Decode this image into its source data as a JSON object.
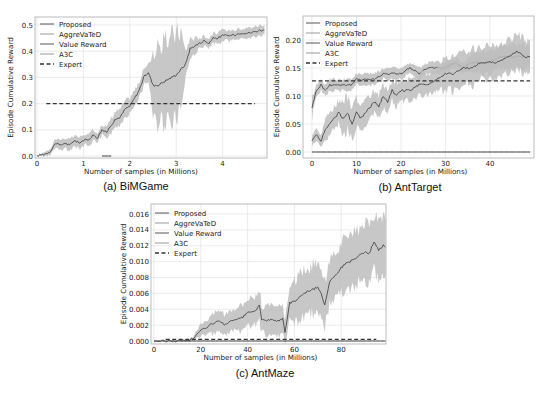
{
  "chart_data": [
    {
      "id": "a",
      "type": "line",
      "caption": "(a) BiMGame",
      "xlabel": "Number of samples (in Millions)",
      "ylabel": "Episode Cumulative Reward",
      "xticks": [
        0,
        1,
        2,
        3,
        4
      ],
      "yticks": [
        "0.0",
        "0.1",
        "0.2",
        "0.3",
        "0.4",
        "0.5"
      ],
      "xlim": [
        0,
        4.9
      ],
      "ylim": [
        0,
        0.52
      ],
      "grid": true,
      "legend_position": "upper left",
      "legend": [
        "Proposed",
        "AggreVaTeD",
        "Value Reward",
        "A3C",
        "Expert"
      ],
      "series": [
        {
          "name": "Proposed",
          "x": [
            0.0,
            0.2,
            0.3,
            0.4,
            0.5,
            0.6,
            0.7,
            0.8,
            0.9,
            1.0,
            1.1,
            1.2,
            1.3,
            1.4,
            1.5,
            1.6,
            1.7,
            1.8,
            1.9,
            2.0,
            2.1,
            2.2,
            2.3,
            2.4,
            2.5,
            2.6,
            2.7,
            2.8,
            2.9,
            3.0,
            3.1,
            3.2,
            3.3,
            3.4,
            3.5,
            3.6,
            3.7,
            3.8,
            3.9,
            4.0,
            4.2,
            4.4,
            4.6,
            4.8,
            4.9
          ],
          "y": [
            0.0,
            0.01,
            0.02,
            0.05,
            0.04,
            0.05,
            0.04,
            0.06,
            0.05,
            0.06,
            0.06,
            0.08,
            0.07,
            0.1,
            0.09,
            0.12,
            0.14,
            0.15,
            0.18,
            0.19,
            0.22,
            0.25,
            0.3,
            0.32,
            0.27,
            0.27,
            0.28,
            0.29,
            0.3,
            0.31,
            0.33,
            0.35,
            0.41,
            0.42,
            0.43,
            0.44,
            0.43,
            0.45,
            0.45,
            0.46,
            0.46,
            0.47,
            0.47,
            0.48,
            0.48
          ],
          "band": [
            0.0,
            0.01,
            0.01,
            0.02,
            0.02,
            0.02,
            0.02,
            0.02,
            0.02,
            0.02,
            0.02,
            0.02,
            0.02,
            0.02,
            0.02,
            0.03,
            0.03,
            0.03,
            0.03,
            0.03,
            0.03,
            0.03,
            0.03,
            0.03,
            0.13,
            0.14,
            0.15,
            0.15,
            0.16,
            0.16,
            0.15,
            0.05,
            0.04,
            0.03,
            0.02,
            0.02,
            0.02,
            0.02,
            0.02,
            0.02,
            0.02,
            0.02,
            0.02,
            0.02,
            0.02
          ]
        },
        {
          "name": "AggreVaTeD",
          "x": [],
          "y": []
        },
        {
          "name": "Value Reward",
          "x": [
            1.4,
            1.6
          ],
          "y": [
            0.0,
            0.0
          ]
        },
        {
          "name": "A3C",
          "x": [],
          "y": []
        },
        {
          "name": "Expert",
          "x": [
            0.2,
            4.7
          ],
          "y": [
            0.2,
            0.2
          ],
          "style": "dashed"
        }
      ]
    },
    {
      "id": "b",
      "type": "line",
      "caption": "(b) AntTarget",
      "xlabel": "Number of samples (in Millions)",
      "ylabel": "Episode Cumulative Reward",
      "xticks": [
        0,
        10,
        20,
        30,
        40
      ],
      "yticks": [
        "0.00",
        "0.05",
        "0.10",
        "0.15",
        "0.20"
      ],
      "xlim": [
        0,
        49
      ],
      "ylim": [
        0,
        0.23
      ],
      "grid": true,
      "legend_position": "upper left",
      "legend": [
        "Proposed",
        "AggreVaTeD",
        "Value Reward",
        "A3C",
        "Expert"
      ],
      "series": [
        {
          "name": "Proposed",
          "x": [
            0,
            1,
            2,
            3,
            4,
            5,
            6,
            7,
            8,
            9,
            10,
            12,
            14,
            16,
            18,
            20,
            22,
            24,
            26,
            28,
            30,
            32,
            34,
            36,
            38,
            40,
            42,
            44,
            46,
            48,
            49
          ],
          "y": [
            0.08,
            0.11,
            0.12,
            0.11,
            0.12,
            0.12,
            0.12,
            0.12,
            0.12,
            0.12,
            0.13,
            0.13,
            0.13,
            0.14,
            0.14,
            0.14,
            0.15,
            0.14,
            0.15,
            0.15,
            0.15,
            0.16,
            0.15,
            0.16,
            0.16,
            0.16,
            0.17,
            0.17,
            0.17,
            0.17,
            0.17
          ],
          "band": [
            0.02,
            0.01,
            0.01,
            0.01,
            0.01,
            0.01,
            0.01,
            0.01,
            0.01,
            0.01,
            0.01,
            0.01,
            0.01,
            0.01,
            0.01,
            0.01,
            0.01,
            0.01,
            0.01,
            0.01,
            0.01,
            0.01,
            0.01,
            0.02,
            0.02,
            0.02,
            0.02,
            0.02,
            0.02,
            0.02,
            0.02
          ]
        },
        {
          "name": "AggreVaTeD",
          "x": [
            0,
            1,
            2,
            3,
            4,
            5,
            6,
            7,
            8,
            9,
            10,
            11,
            12,
            13,
            14,
            15,
            16,
            17,
            18,
            19,
            20,
            22,
            24,
            26,
            28,
            30,
            32,
            34,
            36,
            38,
            40,
            42,
            44,
            46,
            48,
            49
          ],
          "y": [
            0.02,
            0.03,
            0.02,
            0.04,
            0.05,
            0.06,
            0.07,
            0.06,
            0.07,
            0.05,
            0.07,
            0.06,
            0.07,
            0.08,
            0.09,
            0.08,
            0.1,
            0.09,
            0.11,
            0.1,
            0.11,
            0.11,
            0.12,
            0.12,
            0.13,
            0.14,
            0.14,
            0.15,
            0.15,
            0.16,
            0.16,
            0.16,
            0.17,
            0.18,
            0.17,
            0.17
          ],
          "band": [
            0.01,
            0.01,
            0.01,
            0.02,
            0.02,
            0.02,
            0.02,
            0.03,
            0.03,
            0.03,
            0.03,
            0.02,
            0.02,
            0.02,
            0.02,
            0.02,
            0.02,
            0.02,
            0.02,
            0.02,
            0.02,
            0.02,
            0.02,
            0.02,
            0.02,
            0.03,
            0.03,
            0.03,
            0.03,
            0.03,
            0.03,
            0.03,
            0.03,
            0.03,
            0.03,
            0.03
          ]
        },
        {
          "name": "Value Reward",
          "x": [
            0,
            49
          ],
          "y": [
            0.0,
            0.0
          ]
        },
        {
          "name": "A3C",
          "x": [],
          "y": []
        },
        {
          "name": "Expert",
          "x": [
            0,
            49
          ],
          "y": [
            0.127,
            0.127
          ],
          "style": "dashed"
        }
      ]
    },
    {
      "id": "c",
      "type": "line",
      "caption": "(c) AntMaze",
      "xlabel": "Number of samples (in Millions)",
      "ylabel": "Episode Cumulative Reward",
      "xticks": [
        0,
        20,
        40,
        60,
        80
      ],
      "yticks": [
        "0.000",
        "0.002",
        "0.004",
        "0.006",
        "0.008",
        "0.010",
        "0.012",
        "0.014",
        "0.016"
      ],
      "xlim": [
        0,
        99
      ],
      "ylim": [
        0,
        0.0172
      ],
      "grid": true,
      "legend_position": "upper left",
      "legend": [
        "Proposed",
        "AggreVaTeD",
        "Value Reward",
        "A3C",
        "Expert"
      ],
      "series": [
        {
          "name": "Proposed",
          "x": [
            0,
            5,
            10,
            15,
            17,
            20,
            22,
            25,
            28,
            30,
            32,
            35,
            38,
            40,
            43,
            45,
            46,
            47,
            50,
            53,
            55,
            56,
            57,
            58,
            60,
            62,
            64,
            66,
            68,
            70,
            72,
            73,
            75,
            78,
            80,
            82,
            85,
            88,
            90,
            92,
            94,
            96,
            98,
            99
          ],
          "y": [
            0.0,
            0.0,
            0.0,
            0.0001,
            0.0004,
            0.0013,
            0.0017,
            0.0022,
            0.0025,
            0.002,
            0.0024,
            0.0026,
            0.003,
            0.0035,
            0.0038,
            0.0044,
            0.0028,
            0.0026,
            0.0026,
            0.0026,
            0.0028,
            0.001,
            0.003,
            0.0048,
            0.005,
            0.0055,
            0.006,
            0.0063,
            0.0065,
            0.0068,
            0.0055,
            0.0045,
            0.0075,
            0.0085,
            0.0092,
            0.0098,
            0.0102,
            0.0108,
            0.0112,
            0.011,
            0.0125,
            0.0115,
            0.012,
            0.0118
          ],
          "band": [
            0,
            0,
            0,
            0.0001,
            0.0003,
            0.0008,
            0.001,
            0.0012,
            0.0014,
            0.0014,
            0.0015,
            0.0016,
            0.0017,
            0.0018,
            0.0019,
            0.002,
            0.0017,
            0.0017,
            0.0017,
            0.0017,
            0.0017,
            0.0012,
            0.002,
            0.0026,
            0.0026,
            0.0027,
            0.0028,
            0.0029,
            0.003,
            0.003,
            0.0028,
            0.0028,
            0.003,
            0.003,
            0.003,
            0.0031,
            0.0032,
            0.0033,
            0.0034,
            0.0034,
            0.0035,
            0.0035,
            0.0035,
            0.0035
          ]
        },
        {
          "name": "AggreVaTeD",
          "x": [],
          "y": []
        },
        {
          "name": "Value Reward",
          "x": [
            0,
            99
          ],
          "y": [
            0.0,
            0.0
          ]
        },
        {
          "name": "A3C",
          "x": [],
          "y": []
        },
        {
          "name": "Expert",
          "x": [
            5,
            95
          ],
          "y": [
            0.0002,
            0.0002
          ],
          "style": "dashed"
        }
      ]
    }
  ],
  "colors": {
    "line": "#3a3a3a",
    "band": "#bdbdbd",
    "expert": "#333333",
    "axes": "#bcbcbc",
    "grid": "#e4e4e4",
    "text": "#222222"
  }
}
